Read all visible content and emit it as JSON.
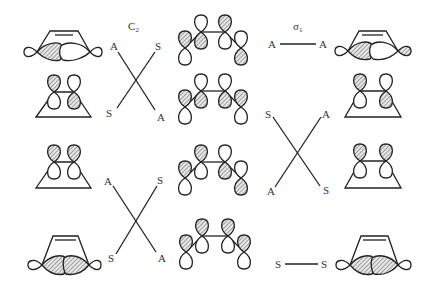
{
  "diagram": {
    "type": "orbital-correlation-diagram",
    "headers": {
      "left_symmetry": "C₂",
      "right_symmetry": "σ₁"
    },
    "left_column": [
      {
        "id": "L1",
        "description": "sigma orbital of cyclobutene (ring with double bond)",
        "row": 1
      },
      {
        "id": "L2",
        "description": "pi orbital on cyclobutene trapezoid",
        "row": 2
      },
      {
        "id": "L3",
        "description": "pi orbital on cyclobutene trapezoid (symmetric)",
        "row": 3
      },
      {
        "id": "L4",
        "description": "sigma bonding orbital of cyclobutene",
        "row": 4
      }
    ],
    "middle_column": [
      {
        "id": "M1",
        "description": "butadiene MO psi4",
        "row": 1
      },
      {
        "id": "M2",
        "description": "butadiene MO psi3",
        "row": 2
      },
      {
        "id": "M3",
        "description": "butadiene MO psi2",
        "row": 3
      },
      {
        "id": "M4",
        "description": "butadiene MO psi1",
        "row": 4
      }
    ],
    "right_column": [
      {
        "id": "R1",
        "description": "sigma* orbital of cyclobutene",
        "row": 1
      },
      {
        "id": "R2",
        "description": "pi* orbital on trapezoid",
        "row": 2
      },
      {
        "id": "R3",
        "description": "pi orbital on trapezoid",
        "row": 3
      },
      {
        "id": "R4",
        "description": "sigma orbital of cyclobutene",
        "row": 4
      }
    ],
    "c2_correlations": {
      "cross_top": {
        "top_left": "A",
        "top_right": "S",
        "bottom_left": "S",
        "bottom_right": "A"
      },
      "cross_bottom": {
        "top_left": "A",
        "top_right": "S",
        "bottom_left": "S",
        "bottom_right": "A"
      }
    },
    "sigma_correlations": {
      "line_top": {
        "left": "A",
        "right": "A"
      },
      "cross_middle": {
        "top_left": "S",
        "top_right": "A",
        "bottom_left": "A",
        "bottom_right": "S"
      },
      "line_bottom": {
        "left": "S",
        "right": "S"
      }
    }
  }
}
